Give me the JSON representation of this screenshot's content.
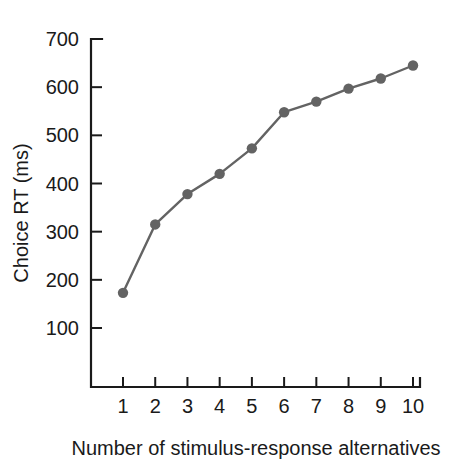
{
  "chart_data": {
    "type": "line",
    "title": "",
    "subtitle": "",
    "xlabel": "Number of stimulus-response alternatives",
    "ylabel": "Choice RT (ms)",
    "x": [
      1,
      2,
      3,
      4,
      5,
      6,
      7,
      8,
      9,
      10
    ],
    "categories": [
      "1",
      "2",
      "3",
      "4",
      "5",
      "6",
      "7",
      "8",
      "9",
      "10"
    ],
    "values": [
      173,
      315,
      378,
      420,
      473,
      548,
      570,
      597,
      618,
      645
    ],
    "series": [
      {
        "name": "Choice RT",
        "values": [
          173,
          315,
          378,
          420,
          473,
          548,
          570,
          597,
          618,
          645
        ]
      }
    ],
    "xlim": [
      0.4,
      10.6
    ],
    "ylim": [
      40,
      700
    ],
    "xticks": [
      1,
      2,
      3,
      4,
      5,
      6,
      7,
      8,
      9,
      10
    ],
    "xtick_labels": [
      "1",
      "2",
      "3",
      "4",
      "5",
      "6",
      "7",
      "8",
      "9",
      "10"
    ],
    "yticks": [
      100,
      200,
      300,
      400,
      500,
      600,
      700
    ],
    "ytick_labels": [
      "100",
      "200",
      "300",
      "400",
      "500",
      "600",
      "700"
    ],
    "grid": false,
    "legend": "none",
    "marker": "circle",
    "line_color": "#636363",
    "marker_color": "#636363",
    "axis_color": "#1a1a1a",
    "background": "#ffffff"
  },
  "axes": {
    "y_title": "Choice RT (ms)",
    "x_title": "Number of stimulus-response alternatives",
    "y_ticks": [
      {
        "label": "700",
        "value": 700
      },
      {
        "label": "600",
        "value": 600
      },
      {
        "label": "500",
        "value": 500
      },
      {
        "label": "400",
        "value": 400
      },
      {
        "label": "300",
        "value": 300
      },
      {
        "label": "200",
        "value": 200
      },
      {
        "label": "100",
        "value": 100
      }
    ],
    "x_ticks": [
      {
        "label": "1",
        "value": 1
      },
      {
        "label": "2",
        "value": 2
      },
      {
        "label": "3",
        "value": 3
      },
      {
        "label": "4",
        "value": 4
      },
      {
        "label": "5",
        "value": 5
      },
      {
        "label": "6",
        "value": 6
      },
      {
        "label": "7",
        "value": 7
      },
      {
        "label": "8",
        "value": 8
      },
      {
        "label": "9",
        "value": 9
      },
      {
        "label": "10",
        "value": 10
      }
    ]
  }
}
